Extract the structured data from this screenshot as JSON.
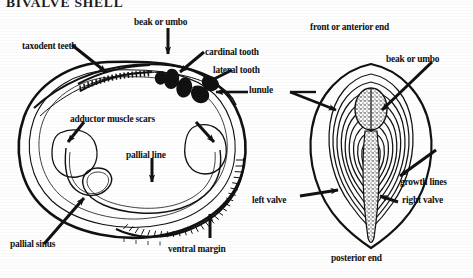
{
  "figure": {
    "title": "BIVALVE SHELL",
    "background_color": "#fefefe",
    "ink_color": "#111111"
  },
  "left_diagram": {
    "name": "left valve interior view",
    "labels": [
      {
        "id": "taxodent-teeth",
        "text": "taxodent teeth"
      },
      {
        "id": "beak-or-umbo",
        "text": "beak or umbo"
      },
      {
        "id": "cardinal-tooth",
        "text": "cardinal tooth"
      },
      {
        "id": "lateral-tooth",
        "text": "lateral tooth"
      },
      {
        "id": "lunule",
        "text": "lunule"
      },
      {
        "id": "adductor-muscle-scars",
        "text": "adductor muscle scars"
      },
      {
        "id": "pallial-line",
        "text": "pallial line"
      },
      {
        "id": "pallial-sinus",
        "text": "pallial sinus"
      },
      {
        "id": "ventral-margin",
        "text": "ventral margin"
      }
    ]
  },
  "right_diagram": {
    "name": "exterior dorsal view of both valves",
    "labels": [
      {
        "id": "front-or-anterior-end",
        "text": "front or anterior end"
      },
      {
        "id": "beak-or-umbo-right",
        "text": "beak or umbo"
      },
      {
        "id": "growth-lines",
        "text": "growth lines"
      },
      {
        "id": "left-valve",
        "text": "left valve"
      },
      {
        "id": "right-valve",
        "text": "right valve"
      },
      {
        "id": "posterior-end",
        "text": "posterior end"
      }
    ]
  }
}
